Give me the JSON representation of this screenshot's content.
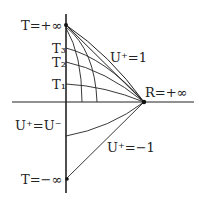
{
  "labels": {
    "t_plus_inf": "T=+∞",
    "t3": "T₃",
    "t2": "T₂",
    "t1": "T₁",
    "u_plus_1": "U⁺=1",
    "r_plus_inf": "R=+∞",
    "u_plus_eq_u_minus": "U⁺=U⁻",
    "u_plus_minus_1": "U⁺=−1",
    "t_minus_inf": "T=−∞"
  }
}
